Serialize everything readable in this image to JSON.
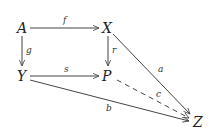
{
  "diagram": {
    "type": "commutative-diagram",
    "nodes": {
      "A": "A",
      "X": "X",
      "Y": "Y",
      "P": "P",
      "Z": "Z"
    },
    "arrows": [
      {
        "from": "A",
        "to": "X",
        "label": "f",
        "style": "solid"
      },
      {
        "from": "A",
        "to": "Y",
        "label": "g",
        "style": "solid"
      },
      {
        "from": "X",
        "to": "P",
        "label": "r",
        "style": "solid"
      },
      {
        "from": "Y",
        "to": "P",
        "label": "s",
        "style": "solid"
      },
      {
        "from": "X",
        "to": "Z",
        "label": "a",
        "style": "solid"
      },
      {
        "from": "Y",
        "to": "Z",
        "label": "b",
        "style": "solid"
      },
      {
        "from": "P",
        "to": "Z",
        "label": "c",
        "style": "dashed"
      }
    ]
  }
}
